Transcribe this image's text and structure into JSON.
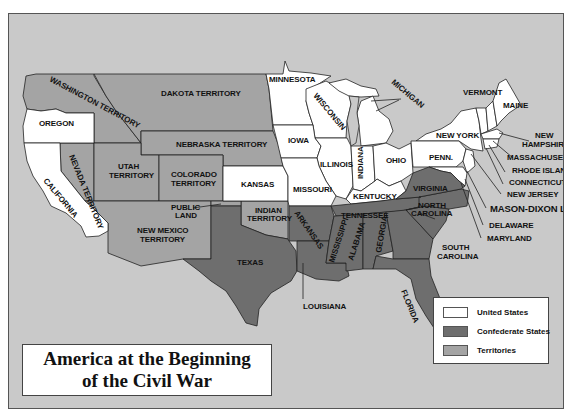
{
  "title": {
    "line1": "America at the Beginning",
    "line2": "of the Civil War"
  },
  "legend": {
    "items": [
      {
        "label": "United States",
        "color": "#ffffff"
      },
      {
        "label": "Confederate States",
        "color": "#6e6e6e"
      },
      {
        "label": "Territories",
        "color": "#a4a4a4"
      }
    ]
  },
  "colors": {
    "ocean": "#c9c9c9",
    "united_states": "#ffffff",
    "confederate_states": "#6e6e6e",
    "territories": "#a4a4a4"
  },
  "labels": {
    "washington": "WASHINGTON TERRITORY",
    "oregon": "OREGON",
    "california": "CALIFORNIA",
    "nevada": "NEVADA TERRITORY",
    "utah_1": "UTAH",
    "utah_2": "TERRITORY",
    "colorado_1": "COLORADO",
    "colorado_2": "TERRITORY",
    "dakota": "DAKOTA TERRITORY",
    "nebraska": "NEBRASKA TERRITORY",
    "kansas": "KANSAS",
    "public_land_1": "PUBLIC",
    "public_land_2": "LAND",
    "new_mexico_1": "NEW MEXICO",
    "new_mexico_2": "TERRITORY",
    "indian_1": "INDIAN",
    "indian_2": "TERRITORY",
    "texas": "TEXAS",
    "minnesota": "MINNESOTA",
    "wisconsin": "WISCONSIN",
    "michigan": "MICHIGAN",
    "iowa": "IOWA",
    "illinois": "ILLINOIS",
    "indiana": "INDIANA",
    "ohio": "OHIO",
    "missouri": "MISSOURI",
    "kentucky": "KENTUCKY",
    "arkansas": "ARKANSAS",
    "tennessee": "TENNESSEE",
    "louisiana": "LOUISIANA",
    "mississippi": "MISSISSIPPI",
    "alabama": "ALABAMA",
    "georgia": "GEORGIA",
    "florida": "FLORIDA",
    "virginia": "VIRGINIA",
    "north_carolina_1": "NORTH",
    "north_carolina_2": "CAROLINA",
    "south_carolina_1": "SOUTH",
    "south_carolina_2": "CAROLINA",
    "new_york": "NEW YORK",
    "penn": "PENN.",
    "vermont": "VERMONT",
    "maine": "MAINE",
    "new_hampshire_1": "NEW",
    "new_hampshire_2": "HAMPSHIRE",
    "massachusetts": "MASSACHUSETTS",
    "rhode_island": "RHODE ISLAND",
    "connecticut": "CONNECTICUT",
    "new_jersey": "NEW JERSEY",
    "mason_dixon": "MASON-DIXON LINE",
    "delaware": "DELAWARE",
    "maryland": "MARYLAND"
  }
}
